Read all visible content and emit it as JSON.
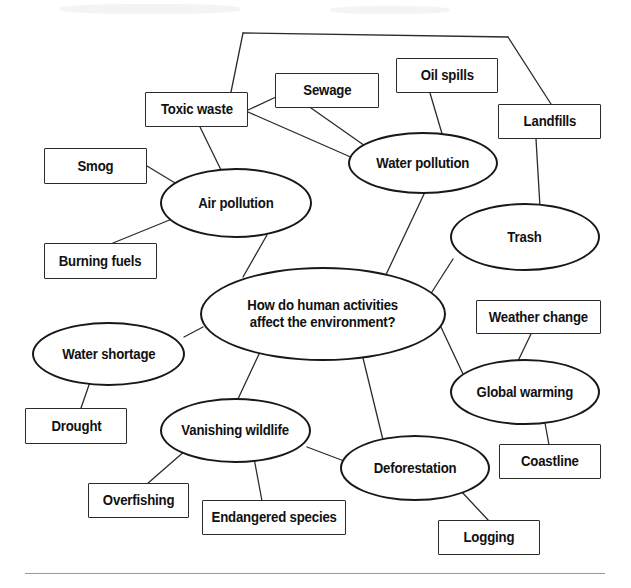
{
  "diagram": {
    "type": "concept-map",
    "title": "How do human activities affect the environment?",
    "background_color": "#ffffff",
    "line_color": "#2b2b2b",
    "text_color": "#111111",
    "central_node": {
      "id": "central",
      "shape": "ellipse",
      "label": "How do human activities\naffect the environment?",
      "x": 200,
      "y": 267,
      "w": 246,
      "h": 94,
      "font_size": 15
    },
    "nodes": [
      {
        "id": "toxic-waste",
        "shape": "box",
        "label": "Toxic waste",
        "x": 145,
        "y": 92,
        "w": 103,
        "h": 35,
        "font_size": 15
      },
      {
        "id": "sewage",
        "shape": "box",
        "label": "Sewage",
        "x": 275,
        "y": 73,
        "w": 104,
        "h": 35,
        "font_size": 15
      },
      {
        "id": "oil-spills",
        "shape": "box",
        "label": "Oil spills",
        "x": 396,
        "y": 58,
        "w": 102,
        "h": 35,
        "font_size": 15
      },
      {
        "id": "landfills",
        "shape": "box",
        "label": "Landfills",
        "x": 498,
        "y": 104,
        "w": 103,
        "h": 35,
        "font_size": 15
      },
      {
        "id": "smog",
        "shape": "box",
        "label": "Smog",
        "x": 44,
        "y": 148,
        "w": 103,
        "h": 36,
        "font_size": 15
      },
      {
        "id": "burning-fuels",
        "shape": "box",
        "label": "Burning fuels",
        "x": 44,
        "y": 243,
        "w": 113,
        "h": 36,
        "font_size": 15
      },
      {
        "id": "water-pollution",
        "shape": "ellipse",
        "label": "Water pollution",
        "x": 348,
        "y": 132,
        "w": 150,
        "h": 62,
        "font_size": 15
      },
      {
        "id": "air-pollution",
        "shape": "ellipse",
        "label": "Air pollution",
        "x": 160,
        "y": 168,
        "w": 152,
        "h": 70,
        "font_size": 15
      },
      {
        "id": "trash",
        "shape": "ellipse",
        "label": "Trash",
        "x": 450,
        "y": 203,
        "w": 150,
        "h": 68,
        "font_size": 15
      },
      {
        "id": "weather-change",
        "shape": "box",
        "label": "Weather change",
        "x": 476,
        "y": 300,
        "w": 125,
        "h": 34,
        "font_size": 15
      },
      {
        "id": "global-warming",
        "shape": "ellipse",
        "label": "Global warming",
        "x": 450,
        "y": 359,
        "w": 150,
        "h": 66,
        "font_size": 15
      },
      {
        "id": "coastline",
        "shape": "box",
        "label": "Coastline",
        "x": 499,
        "y": 444,
        "w": 102,
        "h": 35,
        "font_size": 15
      },
      {
        "id": "water-shortage",
        "shape": "ellipse",
        "label": "Water shortage",
        "x": 32,
        "y": 322,
        "w": 153,
        "h": 64,
        "font_size": 15
      },
      {
        "id": "drought",
        "shape": "box",
        "label": "Drought",
        "x": 25,
        "y": 408,
        "w": 102,
        "h": 36,
        "font_size": 15
      },
      {
        "id": "vanishing-wildlife",
        "shape": "ellipse",
        "label": "Vanishing wildlife",
        "x": 160,
        "y": 398,
        "w": 151,
        "h": 65,
        "font_size": 15
      },
      {
        "id": "overfishing",
        "shape": "box",
        "label": "Overfishing",
        "x": 88,
        "y": 483,
        "w": 101,
        "h": 35,
        "font_size": 15
      },
      {
        "id": "endangered-species",
        "shape": "box",
        "label": "Endangered species",
        "x": 202,
        "y": 500,
        "w": 144,
        "h": 35,
        "font_size": 15
      },
      {
        "id": "deforestation",
        "shape": "ellipse",
        "label": "Deforestation",
        "x": 340,
        "y": 435,
        "w": 150,
        "h": 66,
        "font_size": 15
      },
      {
        "id": "logging",
        "shape": "box",
        "label": "Logging",
        "x": 438,
        "y": 520,
        "w": 102,
        "h": 35,
        "font_size": 15
      }
    ],
    "edges": [
      {
        "from": "toxic-waste",
        "to": "hex-top-left-vertex",
        "points": "231,92 243,33"
      },
      {
        "from": "hex-top-vertex",
        "to": "hex-top-right-vertex",
        "points": "243,33 508,37"
      },
      {
        "from": "hex-right-vertex",
        "to": "landfills",
        "points": "508,37 551,104"
      },
      {
        "from": "toxic-waste",
        "to": "sewage",
        "points": "248,110 276,97"
      },
      {
        "from": "toxic-waste",
        "to": "water-pollution",
        "points": "248,112 362,162"
      },
      {
        "from": "toxic-waste",
        "to": "air-pollution",
        "points": "200,127 222,172"
      },
      {
        "from": "sewage",
        "to": "water-pollution",
        "points": "311,108 368,148"
      },
      {
        "from": "oil-spills",
        "to": "water-pollution",
        "points": "430,93 443,137"
      },
      {
        "from": "landfills",
        "to": "trash",
        "points": "536,139 540,207"
      },
      {
        "from": "smog",
        "to": "air-pollution",
        "points": "147,166 180,186"
      },
      {
        "from": "burning-fuels",
        "to": "air-pollution",
        "points": "113,243 172,219"
      },
      {
        "from": "air-pollution",
        "to": "central",
        "points": "267,235 243,277"
      },
      {
        "from": "water-pollution",
        "to": "central",
        "points": "425,192 383,281"
      },
      {
        "from": "trash",
        "to": "central",
        "points": "453,259 423,306"
      },
      {
        "from": "central",
        "to": "water-shortage",
        "points": "203,327 184,337"
      },
      {
        "from": "central",
        "to": "global-warming",
        "points": "440,325 463,374"
      },
      {
        "from": "central",
        "to": "vanishing-wildlife",
        "points": "260,352 237,401"
      },
      {
        "from": "central",
        "to": "deforestation",
        "points": "363,358 383,440"
      },
      {
        "from": "water-shortage",
        "to": "drought",
        "points": "90,382 81,408"
      },
      {
        "from": "vanishing-wildlife",
        "to": "overfishing",
        "points": "186,450 147,484"
      },
      {
        "from": "vanishing-wildlife",
        "to": "endangered-species",
        "points": "254,458 262,501"
      },
      {
        "from": "vanishing-wildlife",
        "to": "deforestation",
        "points": "307,447 352,464"
      },
      {
        "from": "weather-change",
        "to": "global-warming",
        "points": "531,334 517,363"
      },
      {
        "from": "global-warming",
        "to": "coastline",
        "points": "545,423 549,445"
      },
      {
        "from": "deforestation",
        "to": "logging",
        "points": "460,490 489,521"
      }
    ],
    "bottom_rule": {
      "x": 25,
      "y": 573,
      "w": 580
    }
  }
}
